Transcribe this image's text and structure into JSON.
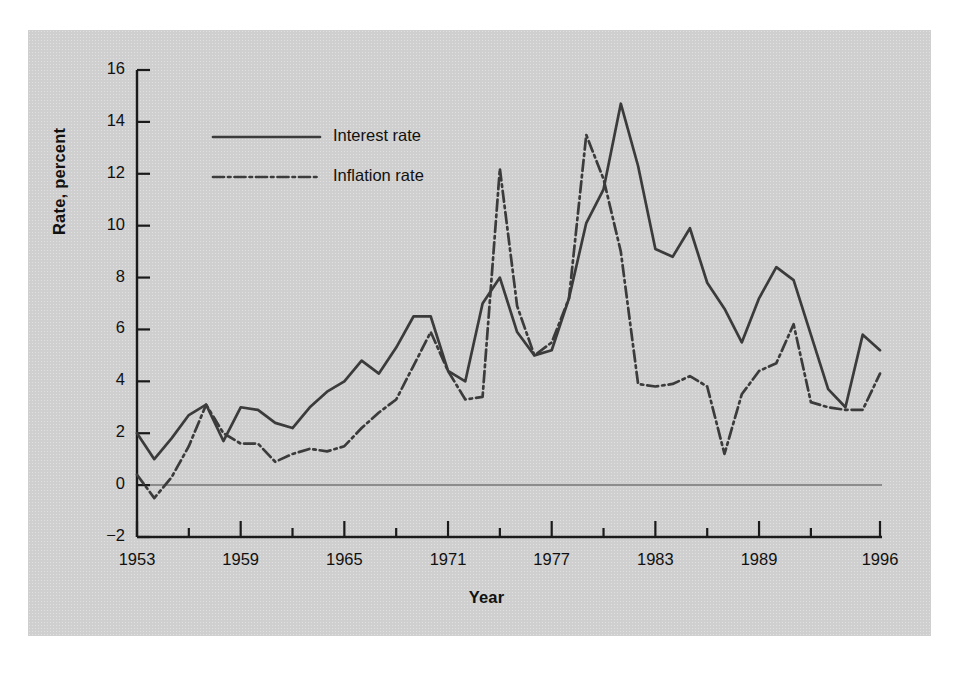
{
  "chart_data": {
    "type": "line",
    "title": "",
    "xlabel": "Year",
    "ylabel": "Rate, percent",
    "xlim": [
      1953,
      1996
    ],
    "ylim": [
      -2,
      16
    ],
    "ytick_values": [
      -2,
      0,
      2,
      4,
      6,
      8,
      10,
      12,
      14,
      16
    ],
    "ytick_labels": [
      "−2",
      "0",
      "2",
      "4",
      "6",
      "8",
      "10",
      "12",
      "14",
      "16"
    ],
    "xtick_values": [
      1953,
      1956,
      1959,
      1962,
      1965,
      1968,
      1971,
      1974,
      1977,
      1980,
      1983,
      1986,
      1989,
      1992,
      1996
    ],
    "xtick_labels_shown": [
      "1953",
      "1959",
      "1965",
      "1971",
      "1977",
      "1983",
      "1989",
      "1996"
    ],
    "xtick_labeled_values": [
      1953,
      1959,
      1965,
      1971,
      1977,
      1983,
      1989,
      1996
    ],
    "grid": false,
    "zero_reference_line": true,
    "legend_position": "upper-left-inside",
    "x": [
      1953,
      1954,
      1955,
      1956,
      1957,
      1958,
      1959,
      1960,
      1961,
      1962,
      1963,
      1964,
      1965,
      1966,
      1967,
      1968,
      1969,
      1970,
      1971,
      1972,
      1973,
      1974,
      1975,
      1976,
      1977,
      1978,
      1979,
      1980,
      1981,
      1982,
      1983,
      1984,
      1985,
      1986,
      1987,
      1988,
      1989,
      1990,
      1991,
      1992,
      1993,
      1994,
      1995,
      1996
    ],
    "series": [
      {
        "name": "Interest rate",
        "style": "solid",
        "color": "#3b3b3b",
        "values": [
          2.0,
          1.0,
          1.8,
          2.7,
          3.1,
          1.7,
          3.0,
          2.9,
          2.4,
          2.2,
          3.0,
          3.6,
          4.0,
          4.8,
          4.3,
          5.3,
          6.5,
          6.5,
          4.4,
          4.0,
          7.0,
          8.0,
          5.9,
          5.0,
          5.2,
          7.2,
          10.1,
          11.4,
          14.7,
          12.3,
          9.1,
          8.8,
          9.9,
          7.8,
          6.8,
          5.5,
          7.2,
          8.4,
          7.9,
          5.8,
          3.7,
          3.0,
          5.8,
          5.2
        ]
      },
      {
        "name": "Inflation rate",
        "style": "dash-dot",
        "color": "#3b3b3b",
        "values": [
          0.4,
          -0.5,
          0.3,
          1.5,
          3.1,
          2.0,
          1.6,
          1.6,
          0.9,
          1.2,
          1.4,
          1.3,
          1.5,
          2.2,
          2.8,
          3.3,
          4.6,
          5.9,
          4.4,
          3.3,
          3.4,
          12.2,
          6.9,
          5.0,
          5.5,
          7.2,
          13.5,
          11.8,
          9.0,
          3.9,
          3.8,
          3.9,
          4.2,
          3.8,
          1.2,
          3.5,
          4.4,
          4.7,
          6.2,
          3.2,
          3.0,
          2.9,
          2.9,
          4.3
        ]
      }
    ],
    "annotations": []
  },
  "legend": {
    "entries": [
      {
        "label": "Interest rate"
      },
      {
        "label": "Inflation rate"
      }
    ]
  },
  "axes": {
    "y_title": "Rate, percent",
    "x_title": "Year"
  }
}
